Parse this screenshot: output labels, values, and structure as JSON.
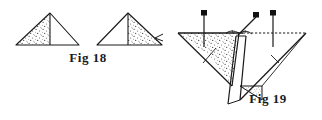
{
  "figure": {
    "kind": "line-drawing",
    "background_color": "#ffffff",
    "ink_color": "#1a1a1a",
    "stipple_color": "#3a3a3a",
    "panels": [
      {
        "id": "fig18",
        "label": "Fig 18",
        "label_position": {
          "x": 88,
          "y": 62
        },
        "description": "Two isosceles triangles with a vertical median; one half of each is stippled",
        "shapes": [
          {
            "name": "triangle-left",
            "apex": {
              "x": 50,
              "y": 13
            },
            "base_left": {
              "x": 16,
              "y": 45
            },
            "base_right": {
              "x": 79,
              "y": 45
            },
            "median_x": 50,
            "shaded_half": "left"
          },
          {
            "name": "triangle-right",
            "apex": {
              "x": 128,
              "y": 13
            },
            "base_left": {
              "x": 97,
              "y": 45
            },
            "base_right": {
              "x": 162,
              "y": 45
            },
            "median_x": 128,
            "shaded_half": "right"
          }
        ]
      },
      {
        "id": "fig19",
        "label": "Fig 19",
        "label_position": {
          "x": 268,
          "y": 103
        },
        "description": "Perspective view of a folded triangular sheet held by three pins on a horizontal edge",
        "top_edge": {
          "x1": 178,
          "y1": 33,
          "x2": 306,
          "y2": 33
        },
        "lower_apex": {
          "x": 232,
          "y": 86
        },
        "shaded_region": "left half of the inverted triangle",
        "pins": [
          {
            "name": "pin-left",
            "head": {
              "x": 204,
              "y": 13
            },
            "tip": {
              "x": 204,
              "y": 45
            },
            "orientation": "vertical"
          },
          {
            "name": "pin-center-angled",
            "head": {
              "x": 256,
              "y": 15
            },
            "tip": {
              "x": 239,
              "y": 33
            },
            "orientation": "angled"
          },
          {
            "name": "pin-right",
            "head": {
              "x": 273,
              "y": 13
            },
            "tip": {
              "x": 273,
              "y": 45
            },
            "orientation": "vertical"
          }
        ],
        "small_shaded_triangle": {
          "x1": 240,
          "y1": 86,
          "x2": 262,
          "y2": 86,
          "x3": 262,
          "y3": 100
        }
      }
    ]
  }
}
